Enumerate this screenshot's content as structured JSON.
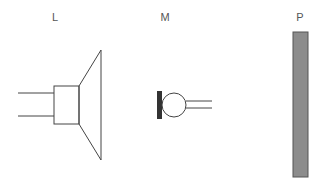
{
  "labels": {
    "speaker": "L",
    "microphone": "M",
    "plate": "P"
  },
  "colors": {
    "line": "#444444",
    "plate_fill": "#8c8c8c",
    "plate_border": "#555555",
    "mic_diaphragm": "#333333",
    "label": "#555555"
  }
}
